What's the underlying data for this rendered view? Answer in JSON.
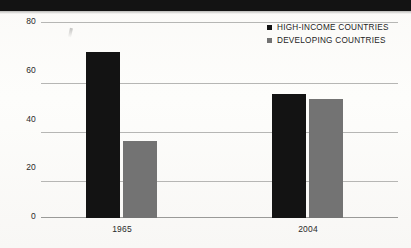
{
  "figure": {
    "background_color": "#fdfcfa",
    "banner_color": "#131313"
  },
  "legend": {
    "position": "top-right",
    "entries": [
      {
        "label": "HIGH-INCOME COUNTRIES",
        "color": "#131313",
        "swatch": "square-swatch-dark"
      },
      {
        "label": "DEVELOPING COUNTRIES",
        "color": "#737373",
        "swatch": "square-swatch-gray"
      }
    ]
  },
  "axes": {
    "y_ticks": [
      "80",
      "60",
      "40",
      "20",
      "0"
    ],
    "x_ticks": [
      "1965",
      "2004"
    ]
  },
  "artifacts": {
    "bleed_center": "",
    "bleed_left": "",
    "bleed_right": ""
  },
  "chart_data": {
    "type": "bar",
    "title": "",
    "subtitle": "",
    "xlabel": "",
    "ylabel": "",
    "categories": [
      "1965",
      "2004"
    ],
    "series": [
      {
        "name": "HIGH-INCOME COUNTRIES",
        "color": "#131313",
        "values": [
          68,
          51
        ]
      },
      {
        "name": "DEVELOPING COUNTRIES",
        "color": "#737373",
        "values": [
          31.5,
          49
        ]
      }
    ],
    "ylim": [
      0,
      80
    ],
    "ytick_values": [
      0,
      20,
      40,
      60,
      80
    ],
    "grid": true,
    "grid_axis": "y",
    "legend_position": "top-right"
  }
}
